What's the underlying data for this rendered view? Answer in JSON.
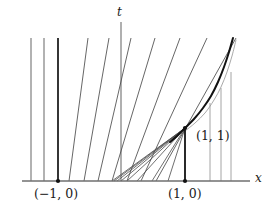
{
  "figure": {
    "kind": "spacetime-characteristics-diagram",
    "width": 278,
    "height": 218,
    "background": "#ffffff"
  },
  "axes": {
    "x_axis": {
      "label": "x",
      "label_pos": {
        "x": 255,
        "y": 172
      },
      "y_pixel": 181,
      "x_start": 22,
      "x_end": 250,
      "color": "#6f6f6f",
      "stroke_width": 1.4
    },
    "t_axis": {
      "label": "t",
      "label_pos": {
        "x": 117,
        "y": 6
      },
      "x_pixel": 121,
      "y_top": 22,
      "y_bottom": 181,
      "color": "#6f6f6f",
      "stroke_width": 1.1
    }
  },
  "points": [
    {
      "name": "point-minus-one-zero",
      "label": "(−1, 0)",
      "label_pos": {
        "x": 34,
        "y": 188
      },
      "dot": {
        "x": 58,
        "y": 181
      },
      "dot_r": 2.1,
      "color": "#111111"
    },
    {
      "name": "point-one-zero",
      "label": "(1, 0)",
      "label_pos": {
        "x": 168,
        "y": 188
      },
      "dot": {
        "x": 185,
        "y": 181
      },
      "dot_r": 2.1,
      "color": "#111111"
    },
    {
      "name": "point-one-one",
      "label": "(1, 1)",
      "label_pos": {
        "x": 196,
        "y": 130
      },
      "dot": {
        "x": 185,
        "y": 128
      },
      "dot_r": 2.1,
      "color": "#111111"
    }
  ],
  "chart_data": {
    "type": "line",
    "title": "",
    "xlabel": "x",
    "ylabel": "t",
    "grid": false,
    "legend": null,
    "axis_origin_px": {
      "x": 121,
      "y": 181
    },
    "top_clip_px": 38,
    "vertical_characteristics_left": [
      {
        "x_px": 31,
        "y_top_px": 38,
        "y_bottom_px": 181,
        "weight": "thin"
      },
      {
        "x_px": 44,
        "y_top_px": 38,
        "y_bottom_px": 181,
        "weight": "thin"
      },
      {
        "x_px": 58,
        "y_top_px": 38,
        "y_bottom_px": 181,
        "weight": "bold"
      }
    ],
    "slanted_characteristics": [
      {
        "x_bottom_px": 69,
        "x_top_px": 88,
        "y_top_px": 38,
        "weight": "thin"
      },
      {
        "x_bottom_px": 84,
        "x_top_px": 109,
        "y_top_px": 38,
        "weight": "thin"
      },
      {
        "x_bottom_px": 98,
        "x_top_px": 131,
        "y_top_px": 38,
        "weight": "thin"
      },
      {
        "x_bottom_px": 112,
        "x_top_px": 155,
        "y_top_px": 38,
        "weight": "thin"
      },
      {
        "x_bottom_px": 127,
        "x_top_px": 180,
        "y_top_px": 38,
        "weight": "thin"
      },
      {
        "x_bottom_px": 141,
        "x_top_px": 207,
        "y_top_px": 38,
        "weight": "thin"
      },
      {
        "x_bottom_px": 156,
        "x_top_px": 236,
        "y_top_px": 38,
        "weight": "thin"
      }
    ],
    "fan_characteristics_to_1_1": [
      {
        "x_bottom_px": 112,
        "y_bottom_px": 181,
        "x_tip_px": 185,
        "y_tip_px": 128
      },
      {
        "x_bottom_px": 114,
        "y_bottom_px": 181,
        "x_tip_px": 185,
        "y_tip_px": 128
      },
      {
        "x_bottom_px": 117,
        "y_bottom_px": 181,
        "x_tip_px": 185,
        "y_tip_px": 128
      },
      {
        "x_bottom_px": 121,
        "y_bottom_px": 181,
        "x_tip_px": 185,
        "y_tip_px": 128
      },
      {
        "x_bottom_px": 127,
        "y_bottom_px": 181,
        "x_tip_px": 185,
        "y_tip_px": 128
      },
      {
        "x_bottom_px": 137,
        "y_bottom_px": 181,
        "x_tip_px": 185,
        "y_tip_px": 128
      },
      {
        "x_bottom_px": 152,
        "y_bottom_px": 181,
        "x_tip_px": 185,
        "y_tip_px": 128
      },
      {
        "x_bottom_px": 168,
        "y_bottom_px": 181,
        "x_tip_px": 185,
        "y_tip_px": 128
      }
    ],
    "vertical_segment_one": {
      "x_px": 185,
      "y_top_px": 128,
      "y_bottom_px": 181,
      "weight": "bold"
    },
    "right_vertical_characteristics": [
      {
        "x_px": 210,
        "y_bottom_px": 181,
        "y_top_px": 103
      },
      {
        "x_px": 221,
        "y_bottom_px": 181,
        "y_top_px": 88
      },
      {
        "x_px": 231,
        "y_bottom_px": 181,
        "y_top_px": 72
      }
    ],
    "thin_curve_behind_shock": {
      "points_px": [
        [
          185,
          131
        ],
        [
          195,
          123
        ],
        [
          205,
          113
        ],
        [
          214,
          100
        ],
        [
          221,
          87
        ],
        [
          227,
          72
        ],
        [
          232,
          56
        ],
        [
          236,
          40
        ]
      ]
    },
    "shock_curve": {
      "weight": "bold",
      "points_px": [
        [
          170,
          142
        ],
        [
          177,
          136
        ],
        [
          185,
          128
        ],
        [
          194,
          119
        ],
        [
          203,
          108
        ],
        [
          211,
          96
        ],
        [
          218,
          82
        ],
        [
          224,
          67
        ],
        [
          229,
          52
        ],
        [
          233,
          38
        ]
      ]
    }
  },
  "colors": {
    "ink": "#1b1b1b",
    "thin_line": "#4a4a4a",
    "grey_line": "#9a9a9a",
    "bold_line": "#121212",
    "axis": "#6f6f6f",
    "background": "#ffffff"
  }
}
